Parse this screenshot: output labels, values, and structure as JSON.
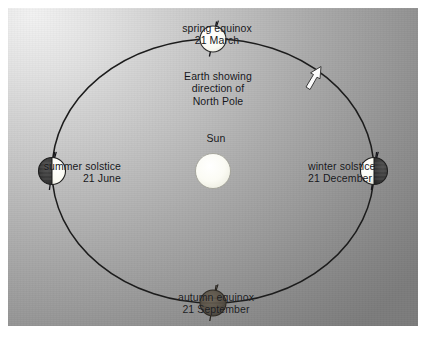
{
  "figure": {
    "background_light": "#f2f2f2",
    "background_dark": "#7c7c7c"
  },
  "sun": {
    "label": "Sun",
    "color": "#fbfbf6"
  },
  "orbit": {
    "direction_note": "counterclockwise",
    "line_color": "#1a1a1a"
  },
  "annotation": {
    "line1": "Earth showing",
    "line2": "direction of",
    "line3": "North Pole"
  },
  "positions": [
    {
      "id": "spring-equinox",
      "name": "spring equinox",
      "date": "21 March",
      "lit_side": "mostly-lit",
      "earth_color_lit": "#fdfdf8",
      "earth_color_dark": "#3a3a3a"
    },
    {
      "id": "summer-solstice",
      "name": "summer solstice",
      "date": "21 June",
      "lit_side": "right",
      "earth_color_lit": "#fdfdf8",
      "earth_color_dark": "#3a3a3a"
    },
    {
      "id": "winter-solstice",
      "name": "winter solstice",
      "date": "21 December",
      "lit_side": "left",
      "earth_color_lit": "#fdfdf8",
      "earth_color_dark": "#3a3a3a"
    },
    {
      "id": "autumn-equinox",
      "name": "autumn equinox",
      "date": "21 September",
      "lit_side": "dark",
      "earth_color_lit": "#6a6257",
      "earth_color_dark": "#4a453e"
    }
  ]
}
